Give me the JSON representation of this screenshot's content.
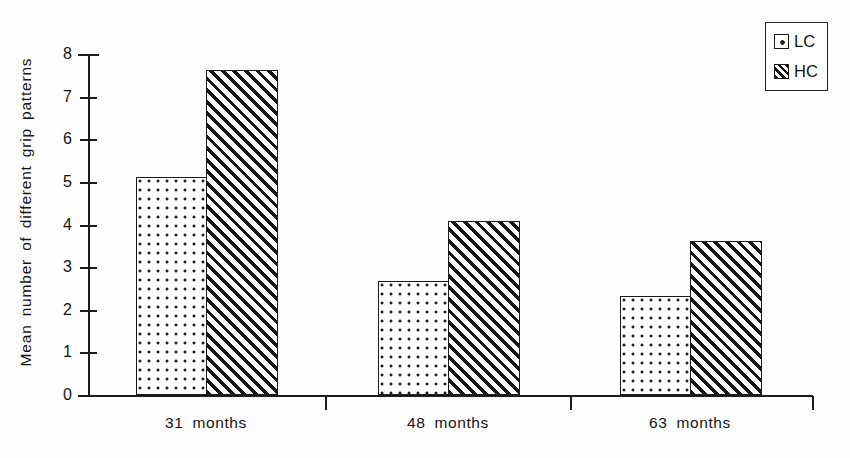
{
  "chart_data": {
    "type": "bar",
    "title": "",
    "xlabel": "",
    "ylabel": "Mean number of different grip patterns",
    "categories": [
      "31 months",
      "48 months",
      "63 months"
    ],
    "series": [
      {
        "name": "LC",
        "pattern": "dotted",
        "values": [
          5.1,
          2.65,
          2.3
        ]
      },
      {
        "name": "HC",
        "pattern": "diagonal-hatch",
        "values": [
          7.6,
          4.05,
          3.6
        ]
      }
    ],
    "ylim": [
      0,
      8
    ],
    "ytick_labels": [
      "0",
      "1",
      "2",
      "3",
      "4",
      "5",
      "6",
      "7",
      "8"
    ],
    "ytick_values": [
      0,
      1,
      2,
      3,
      4,
      5,
      6,
      7,
      8
    ],
    "grid": false,
    "legend_position": "top-right",
    "colors": {
      "line": "#1c1c1c",
      "fill": "#ffffff",
      "pattern": "#151515",
      "background": "#ffffff"
    }
  },
  "legend": {
    "entries": [
      {
        "label": "LC",
        "swatch": "dotted-swatch-icon"
      },
      {
        "label": "HC",
        "swatch": "hatched-swatch-icon"
      }
    ]
  },
  "axes": {
    "y": {
      "title": "Mean number of different grip patterns"
    },
    "x": {
      "tick_labels": [
        "31 months",
        "48 months",
        "63 months"
      ]
    }
  }
}
